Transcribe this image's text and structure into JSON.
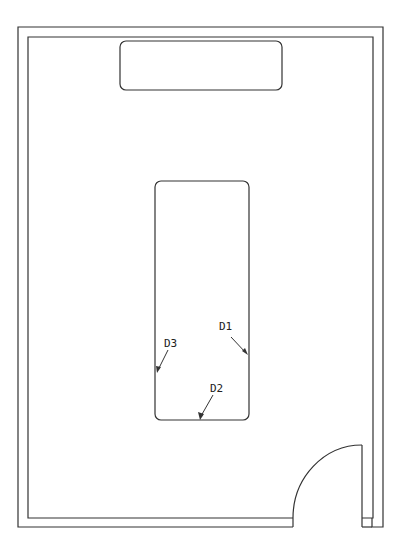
{
  "diagram": {
    "type": "floor-plan",
    "labels": {
      "d1": "D1",
      "d2": "D2",
      "d3": "D3"
    },
    "colors": {
      "line": "#333333",
      "background": "#ffffff"
    }
  }
}
